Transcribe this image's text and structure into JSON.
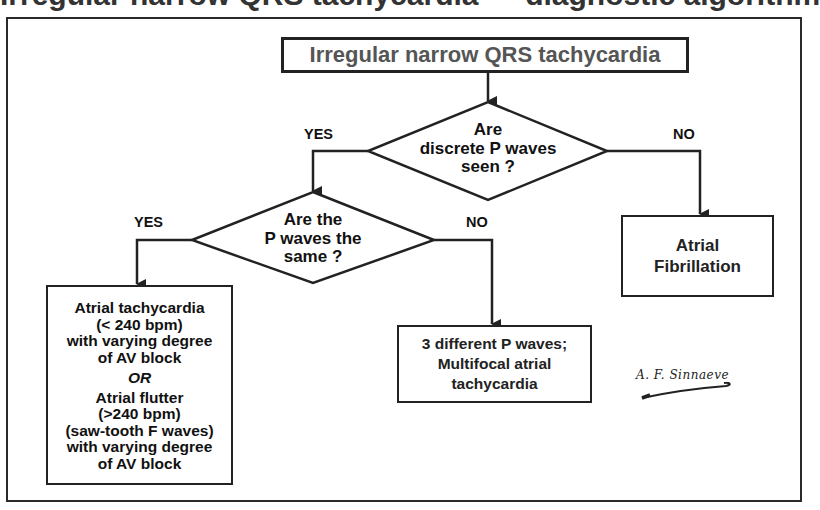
{
  "header": {
    "title_partial": "Irregular narrow QRS tachycardia — diagnostic algorithm"
  },
  "flowchart": {
    "start": {
      "label": "Irregular narrow QRS tachycardia"
    },
    "decision_1": {
      "lines": [
        "Are",
        "discrete P waves",
        "seen ?"
      ],
      "yes_label": "YES",
      "no_label": "NO"
    },
    "decision_2": {
      "lines": [
        "Are the",
        "P waves the",
        "same ?"
      ],
      "yes_label": "YES",
      "no_label": "NO"
    },
    "outcome_af": {
      "lines": [
        "Atrial",
        "Fibrillation"
      ]
    },
    "outcome_mat": {
      "lines": [
        "3 different P waves;",
        "Multifocal atrial",
        "tachycardia"
      ]
    },
    "outcome_at": {
      "part1": [
        "Atrial tachycardia",
        "(< 240 bpm)",
        "with varying degree",
        "of AV block"
      ],
      "or": "OR",
      "part2": [
        "Atrial flutter",
        "(>240 bpm)",
        "(saw-tooth F waves)",
        "with varying degree",
        "of AV block"
      ]
    }
  },
  "signature": {
    "text": "A. F. Sinnaeve"
  },
  "colors": {
    "line": "#222222",
    "start_text": "#555555",
    "background": "#ffffff"
  }
}
